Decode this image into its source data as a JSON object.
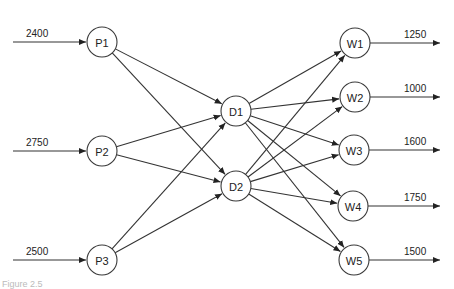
{
  "diagram": {
    "type": "network-flow",
    "nodes": [
      {
        "id": "P1",
        "label": "P1",
        "layer": "plants",
        "x": 102,
        "y": 42
      },
      {
        "id": "P2",
        "label": "P2",
        "layer": "plants",
        "x": 102,
        "y": 151
      },
      {
        "id": "P3",
        "label": "P3",
        "layer": "plants",
        "x": 102,
        "y": 260
      },
      {
        "id": "D1",
        "label": "D1",
        "layer": "distribution",
        "x": 236,
        "y": 111
      },
      {
        "id": "D2",
        "label": "D2",
        "layer": "distribution",
        "x": 236,
        "y": 186
      },
      {
        "id": "W1",
        "label": "W1",
        "layer": "warehouses",
        "x": 355,
        "y": 43
      },
      {
        "id": "W2",
        "label": "W2",
        "layer": "warehouses",
        "x": 355,
        "y": 97
      },
      {
        "id": "W3",
        "label": "W3",
        "layer": "warehouses",
        "x": 354,
        "y": 150
      },
      {
        "id": "W4",
        "label": "W4",
        "layer": "warehouses",
        "x": 353,
        "y": 206
      },
      {
        "id": "W5",
        "label": "W5",
        "layer": "warehouses",
        "x": 354,
        "y": 260
      }
    ],
    "supplies": [
      {
        "node": "P1",
        "value": "2400"
      },
      {
        "node": "P2",
        "value": "2750"
      },
      {
        "node": "P3",
        "value": "2500"
      }
    ],
    "demands": [
      {
        "node": "W1",
        "value": "1250"
      },
      {
        "node": "W2",
        "value": "1000"
      },
      {
        "node": "W3",
        "value": "1600"
      },
      {
        "node": "W4",
        "value": "1750"
      },
      {
        "node": "W5",
        "value": "1500"
      }
    ],
    "edges": [
      [
        "P1",
        "D1"
      ],
      [
        "P1",
        "D2"
      ],
      [
        "P2",
        "D1"
      ],
      [
        "P2",
        "D2"
      ],
      [
        "P3",
        "D1"
      ],
      [
        "P3",
        "D2"
      ],
      [
        "D1",
        "W1"
      ],
      [
        "D1",
        "W2"
      ],
      [
        "D1",
        "W3"
      ],
      [
        "D1",
        "W4"
      ],
      [
        "D1",
        "W5"
      ],
      [
        "D2",
        "W1"
      ],
      [
        "D2",
        "W2"
      ],
      [
        "D2",
        "W3"
      ],
      [
        "D2",
        "W4"
      ],
      [
        "D2",
        "W5"
      ]
    ],
    "caption": "Figure 2.5"
  }
}
